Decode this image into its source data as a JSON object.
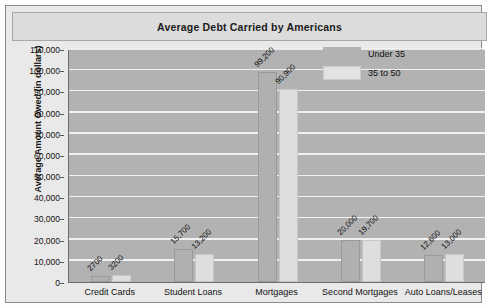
{
  "chart_data": {
    "type": "bar",
    "title": "Average Debt Carried by Americans",
    "xlabel": "",
    "ylabel": "Average Amount Owed (in dollars)",
    "categories": [
      "Credit Cards",
      "Student Loans",
      "Mortgages",
      "Second Mortgages",
      "Auto Loans/Leases"
    ],
    "series": [
      {
        "name": "Under 35",
        "values": [
          2700,
          15700,
          99200,
          20000,
          12600
        ],
        "labels": [
          "2700",
          "15,700",
          "99,200",
          "20,000",
          "12,600"
        ],
        "color": "#b0b0b0"
      },
      {
        "name": "35 to 50",
        "values": [
          3200,
          13200,
          90900,
          19700,
          13000
        ],
        "labels": [
          "3200",
          "13,200",
          "90,900",
          "19,700",
          "13,000"
        ],
        "color": "#dedede"
      }
    ],
    "ylim": [
      0,
      110000
    ],
    "ytick_step": 10000,
    "yticks": [
      "0",
      "10,000",
      "20,000",
      "30,000",
      "40,000",
      "50,000",
      "60,000",
      "70,000",
      "80,000",
      "90,000",
      "100,000",
      "110,000"
    ],
    "grid": true,
    "legend_position": "inside-top-right",
    "plot_background": "#b2b2b2",
    "gridline_color": "#f1f1f1",
    "title_band_color": "#dcdcdc",
    "frame_color": "#8a8a8a"
  }
}
